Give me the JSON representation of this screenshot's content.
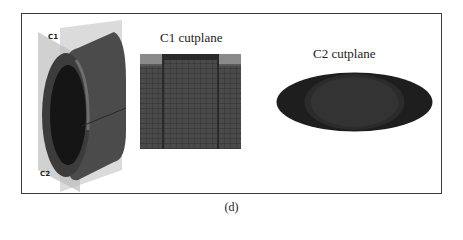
{
  "figure": {
    "caption": "(d)",
    "model": {
      "plane_labels": [
        "C1",
        "C2"
      ]
    },
    "panels": [
      {
        "id": "c1",
        "title": "C1 cutplane"
      },
      {
        "id": "c2",
        "title": "C2 cutplane"
      }
    ]
  }
}
